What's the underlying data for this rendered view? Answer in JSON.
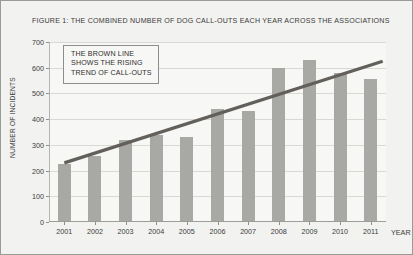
{
  "chart_data": {
    "type": "bar",
    "title": "FIGURE 1: THE COMBINED NUMBER OF DOG CALL-OUTS EACH YEAR ACROSS THE ASSOCIATIONS",
    "xlabel": "YEAR",
    "ylabel": "NUMBER OF INCIDENTS",
    "categories": [
      "2001",
      "2002",
      "2003",
      "2004",
      "2005",
      "2006",
      "2007",
      "2008",
      "2009",
      "2010",
      "2011"
    ],
    "values": [
      225,
      258,
      320,
      340,
      330,
      440,
      430,
      600,
      630,
      578,
      555
    ],
    "series": [
      {
        "name": "Number of incidents",
        "type": "bar",
        "values": [
          225,
          258,
          320,
          340,
          330,
          440,
          430,
          600,
          630,
          578,
          555
        ]
      },
      {
        "name": "Trend of call-outs",
        "type": "line",
        "x": [
          "2001",
          "2011"
        ],
        "values": [
          230,
          625
        ]
      }
    ],
    "ylim": [
      0,
      700
    ],
    "yticks": [
      0,
      100,
      200,
      300,
      400,
      500,
      600,
      700
    ],
    "ytick_labels": [
      "0",
      "100",
      "200",
      "300",
      "400",
      "500",
      "600",
      "700"
    ],
    "grid": true,
    "legend": false,
    "annotations": [
      {
        "name": "trend-note",
        "lines": [
          "THE BROWN LINE",
          "SHOWS THE RISING",
          "TREND OF CALL-OUTS"
        ]
      }
    ],
    "colors": {
      "bar": "#a8a8a4",
      "trend_line": "#63605b",
      "grid": "#d8d8d4",
      "plot_background": "#f7f7f5",
      "figure_background": "#f2f2f0",
      "border": "#9a9a96",
      "text": "#3b3b3b"
    }
  }
}
